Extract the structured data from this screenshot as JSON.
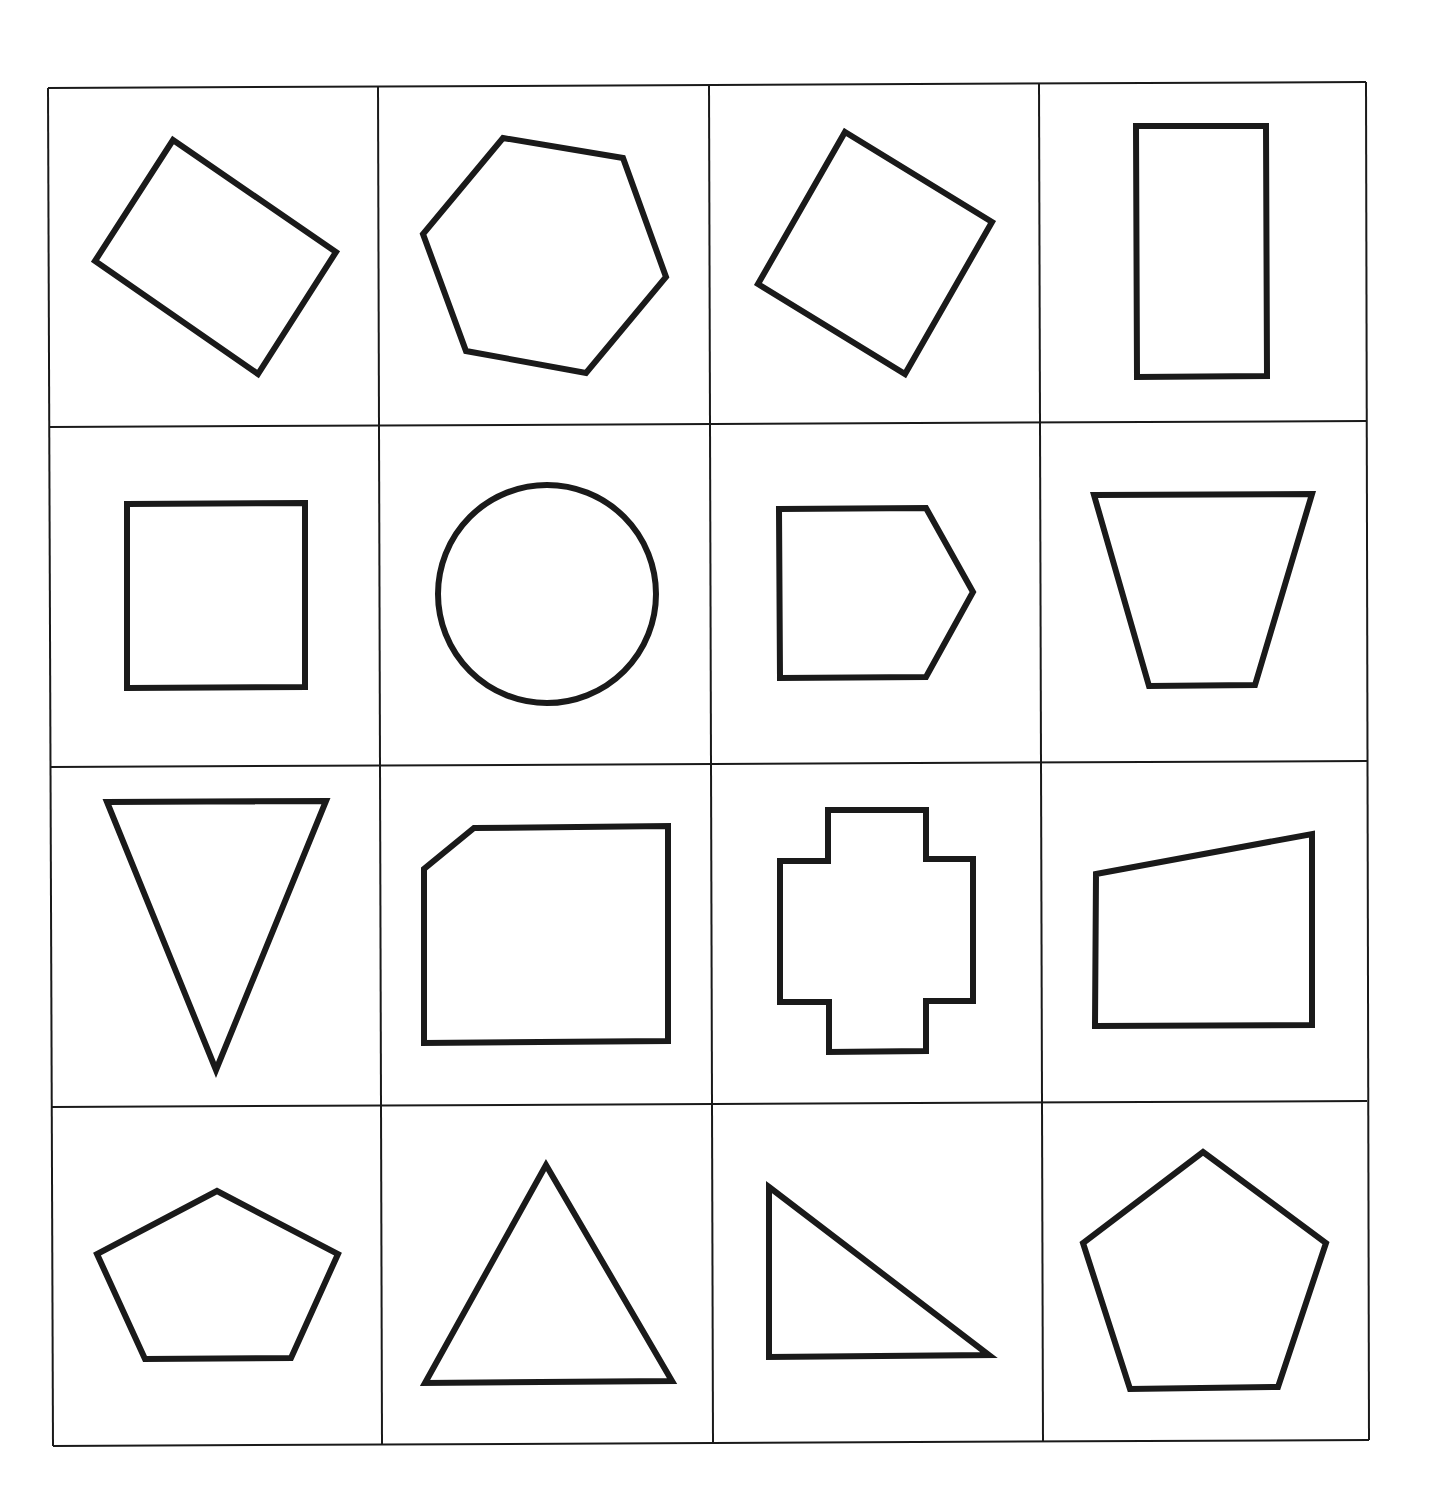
{
  "worksheet": {
    "title": "",
    "grid": {
      "rows": 4,
      "cols": 4,
      "line_color": "#1a1a1a",
      "shape_stroke": "#1a1a1a"
    },
    "grid_lines": {
      "horizontal": [
        [
          [
            48,
            88
          ],
          [
            1366,
            82
          ]
        ],
        [
          [
            50,
            427
          ],
          [
            1367,
            421
          ]
        ],
        [
          [
            51,
            767
          ],
          [
            1367,
            761
          ]
        ],
        [
          [
            52,
            1107
          ],
          [
            1367,
            1101
          ]
        ],
        [
          [
            53,
            1446
          ],
          [
            1369,
            1440
          ]
        ]
      ],
      "vertical": [
        [
          [
            48,
            88
          ],
          [
            53,
            1446
          ]
        ],
        [
          [
            378,
            87
          ],
          [
            382,
            1445
          ]
        ],
        [
          [
            709,
            85
          ],
          [
            713,
            1444
          ]
        ],
        [
          [
            1039,
            84
          ],
          [
            1043,
            1442
          ]
        ],
        [
          [
            1366,
            82
          ],
          [
            1369,
            1440
          ]
        ]
      ]
    },
    "shapes": [
      {
        "id": "r1c1",
        "name": "rotated-rectangle",
        "type": "polygon",
        "points": [
          [
            173,
            140
          ],
          [
            336,
            252
          ],
          [
            258,
            374
          ],
          [
            95,
            261
          ]
        ]
      },
      {
        "id": "r1c2",
        "name": "hexagon",
        "type": "polygon",
        "points": [
          [
            503,
            138
          ],
          [
            623,
            158
          ],
          [
            666,
            277
          ],
          [
            586,
            373
          ],
          [
            466,
            351
          ],
          [
            423,
            234
          ]
        ]
      },
      {
        "id": "r1c3",
        "name": "rotated-square",
        "type": "polygon",
        "points": [
          [
            845,
            132
          ],
          [
            992,
            222
          ],
          [
            905,
            374
          ],
          [
            758,
            284
          ]
        ]
      },
      {
        "id": "r1c4",
        "name": "tall-rectangle",
        "type": "polygon",
        "points": [
          [
            1136,
            126
          ],
          [
            1266,
            126
          ],
          [
            1267,
            376
          ],
          [
            1137,
            377
          ]
        ]
      },
      {
        "id": "r2c1",
        "name": "square",
        "type": "polygon",
        "points": [
          [
            127,
            504
          ],
          [
            305,
            503
          ],
          [
            305,
            687
          ],
          [
            127,
            688
          ]
        ]
      },
      {
        "id": "r2c2",
        "name": "circle",
        "type": "circle",
        "cx": 547,
        "cy": 594,
        "r": 109
      },
      {
        "id": "r2c3",
        "name": "house-pentagon",
        "type": "polygon",
        "points": [
          [
            779,
            509
          ],
          [
            926,
            508
          ],
          [
            973,
            592
          ],
          [
            926,
            677
          ],
          [
            780,
            678
          ]
        ]
      },
      {
        "id": "r2c4",
        "name": "inverted-trapezoid",
        "type": "polygon",
        "points": [
          [
            1094,
            495
          ],
          [
            1312,
            494
          ],
          [
            1255,
            685
          ],
          [
            1149,
            686
          ]
        ]
      },
      {
        "id": "r3c1",
        "name": "inverted-triangle",
        "type": "polygon",
        "points": [
          [
            107,
            802
          ],
          [
            326,
            801
          ],
          [
            216,
            1070
          ]
        ]
      },
      {
        "id": "r3c2",
        "name": "cut-corner-rectangle",
        "type": "polygon",
        "points": [
          [
            474,
            828
          ],
          [
            668,
            826
          ],
          [
            668,
            1041
          ],
          [
            424,
            1043
          ],
          [
            424,
            869
          ]
        ]
      },
      {
        "id": "r3c3",
        "name": "cross-shape",
        "type": "polygon",
        "points": [
          [
            828,
            810
          ],
          [
            926,
            810
          ],
          [
            926,
            859
          ],
          [
            973,
            859
          ],
          [
            973,
            1001
          ],
          [
            926,
            1001
          ],
          [
            926,
            1051
          ],
          [
            829,
            1052
          ],
          [
            829,
            1002
          ],
          [
            780,
            1002
          ],
          [
            780,
            861
          ],
          [
            828,
            861
          ]
        ]
      },
      {
        "id": "r3c4",
        "name": "right-trapezoid",
        "type": "polygon",
        "points": [
          [
            1096,
            874
          ],
          [
            1312,
            834
          ],
          [
            1312,
            1025
          ],
          [
            1095,
            1026
          ]
        ]
      },
      {
        "id": "r4c1",
        "name": "wide-pentagon",
        "type": "polygon",
        "points": [
          [
            217,
            1191
          ],
          [
            338,
            1254
          ],
          [
            291,
            1358
          ],
          [
            145,
            1359
          ],
          [
            97,
            1254
          ]
        ]
      },
      {
        "id": "r4c2",
        "name": "triangle",
        "type": "polygon",
        "points": [
          [
            546,
            1165
          ],
          [
            672,
            1381
          ],
          [
            425,
            1383
          ]
        ]
      },
      {
        "id": "r4c3",
        "name": "right-triangle",
        "type": "polygon",
        "points": [
          [
            769,
            1187
          ],
          [
            989,
            1355
          ],
          [
            769,
            1357
          ]
        ]
      },
      {
        "id": "r4c4",
        "name": "regular-pentagon",
        "type": "polygon",
        "points": [
          [
            1203,
            1152
          ],
          [
            1326,
            1243
          ],
          [
            1278,
            1387
          ],
          [
            1130,
            1389
          ],
          [
            1083,
            1243
          ]
        ]
      }
    ]
  }
}
